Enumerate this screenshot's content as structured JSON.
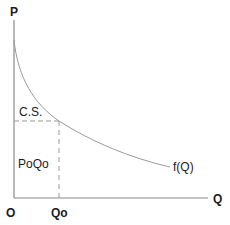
{
  "diagram": {
    "type": "consumer-surplus-demand-curve",
    "axes": {
      "y_label": "P",
      "x_label": "Q",
      "origin_label": "O"
    },
    "curve": {
      "label": "f(Q)"
    },
    "markers": {
      "quantity_label": "Qo"
    },
    "regions": {
      "consumer_surplus_label": "C.S.",
      "expenditure_label": "PoQo"
    },
    "colors": {
      "axis": "#8a8a8a",
      "curve": "#9a9a9a",
      "dashed": "#9a9a9a",
      "text": "#1a1a1a"
    }
  }
}
